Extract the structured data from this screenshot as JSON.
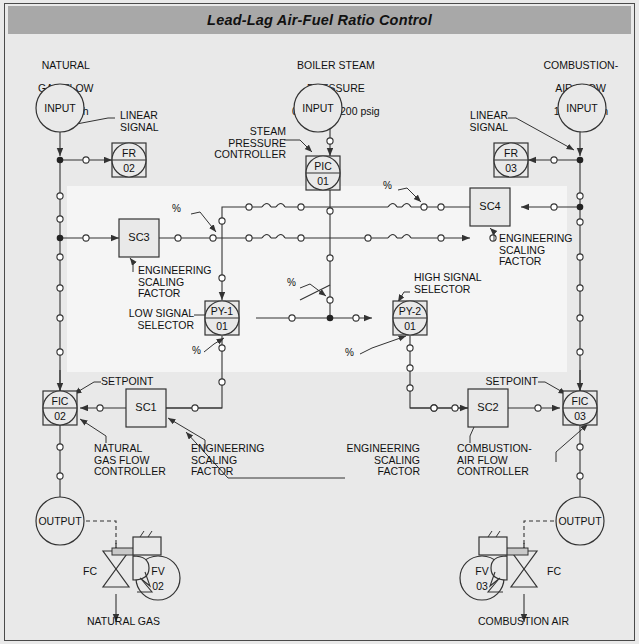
{
  "title": "Lead-Lag Air-Fuel Ratio Control",
  "colors": {
    "title_bar": "#a8a8a8",
    "page_bg": "#e9e9e9",
    "highlight_band": "#f4f4f4",
    "line": "#333333",
    "frame": "#4a4a4a"
  },
  "headers": {
    "left": [
      "NATURAL",
      "GAS FLOW",
      "1000 scfh"
    ],
    "center": [
      "BOILER STEAM",
      "PRESSURE",
      "0 psig TO 200 psig"
    ],
    "right": [
      "COMBUSTION-",
      "AIR FLOW",
      "10,000 scfh"
    ]
  },
  "io_bubbles": {
    "input_left": "INPUT",
    "input_center": "INPUT",
    "input_right": "INPUT",
    "output_left": "OUTPUT",
    "output_right": "OUTPUT"
  },
  "instruments": [
    {
      "id": "fr02",
      "tag": "FR",
      "num": "02",
      "shape": "circle-in-square"
    },
    {
      "id": "fr03",
      "tag": "FR",
      "num": "03",
      "shape": "circle-in-square"
    },
    {
      "id": "pic01",
      "tag": "PIC",
      "num": "01",
      "shape": "circle-in-square"
    },
    {
      "id": "py1",
      "tag": "PY-1",
      "num": "01",
      "shape": "circle-in-square"
    },
    {
      "id": "py2",
      "tag": "PY-2",
      "num": "01",
      "shape": "circle-in-square"
    },
    {
      "id": "fic02",
      "tag": "FIC",
      "num": "02",
      "shape": "circle-in-square"
    },
    {
      "id": "fic03",
      "tag": "FIC",
      "num": "03",
      "shape": "circle-in-square"
    },
    {
      "id": "fv02",
      "tag": "FV",
      "num": "02",
      "shape": "circle"
    },
    {
      "id": "fv03",
      "tag": "FV",
      "num": "03",
      "shape": "circle"
    }
  ],
  "blocks": [
    {
      "id": "sc3",
      "label": "SC3"
    },
    {
      "id": "sc4",
      "label": "SC4"
    },
    {
      "id": "sc1",
      "label": "SC1"
    },
    {
      "id": "sc2",
      "label": "SC2"
    }
  ],
  "annotations": {
    "linear_signal_left": "LINEAR\nSIGNAL",
    "linear_signal_right": "LINEAR\nSIGNAL",
    "steam_pressure_controller": "STEAM\nPRESSURE\nCONTROLLER",
    "eng_scaling_sc3": "ENGINEERING\nSCALING\nFACTOR",
    "eng_scaling_sc4": "ENGINEERING\nSCALING\nFACTOR",
    "eng_scaling_sc1": "ENGINEERING\nSCALING\nFACTOR",
    "eng_scaling_sc2": "ENGINEERING\nSCALING\nFACTOR",
    "low_signal_selector": "LOW SIGNAL\nSELECTOR",
    "high_signal_selector": "HIGH SIGNAL\nSELECTOR",
    "setpoint_left": "SETPOINT",
    "setpoint_right": "SETPOINT",
    "natural_gas_flow_controller": "NATURAL\nGAS FLOW\nCONTROLLER",
    "combustion_air_flow_controller": "COMBUSTION-\nAIR FLOW\nCONTROLLER",
    "fc_left": "FC",
    "fc_right": "FC",
    "natural_gas": "NATURAL GAS",
    "combustion_air": "COMBUSTION AIR"
  },
  "percent_marks": [
    "%",
    "%",
    "%",
    "%",
    "%",
    "%"
  ]
}
